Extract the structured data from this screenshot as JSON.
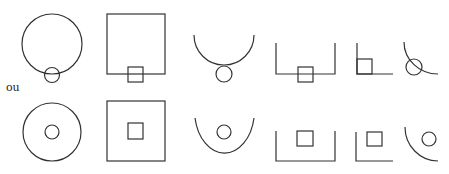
{
  "separator_label": "ou",
  "stroke_color": "#333333",
  "rows": [
    {
      "name": "row-1",
      "description": "small shape straddles the outer boundary",
      "figures": [
        {
          "id": "circle-with-circle-on-edge",
          "outer": "circle",
          "inner": "circle"
        },
        {
          "id": "square-with-square-on-edge",
          "outer": "square",
          "inner": "square"
        },
        {
          "id": "arc-with-circle-on-edge",
          "outer": "semicircle-arc",
          "inner": "circle"
        },
        {
          "id": "open-box-with-square-on-edge",
          "outer": "open-box",
          "inner": "square"
        },
        {
          "id": "corner-with-square-in-corner",
          "outer": "corner",
          "inner": "square"
        },
        {
          "id": "quarter-arc-with-circle-on-edge",
          "outer": "quarter-arc",
          "inner": "circle"
        }
      ]
    },
    {
      "name": "row-2",
      "description": "small shape placed inside the outer boundary",
      "figures": [
        {
          "id": "circle-with-circle-inside",
          "outer": "circle",
          "inner": "circle"
        },
        {
          "id": "square-with-square-inside",
          "outer": "square",
          "inner": "square"
        },
        {
          "id": "arc-with-circle-inside",
          "outer": "semicircle-arc",
          "inner": "circle"
        },
        {
          "id": "open-box-with-square-inside",
          "outer": "open-box",
          "inner": "square"
        },
        {
          "id": "corner-with-square-inside",
          "outer": "corner",
          "inner": "square"
        },
        {
          "id": "quarter-arc-with-circle-inside",
          "outer": "quarter-arc",
          "inner": "circle"
        }
      ]
    }
  ]
}
